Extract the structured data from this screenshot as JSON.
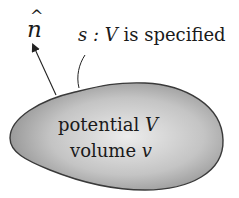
{
  "figure": {
    "normal_vector": {
      "symbol": "n",
      "accent": "^"
    },
    "surface_label": {
      "prefix": "s : ",
      "var": "V",
      "suffix": " is specified"
    },
    "region": {
      "line1": {
        "text": "potential ",
        "var": "V"
      },
      "line2": {
        "text": "volume ",
        "var": "v"
      }
    },
    "colors": {
      "fill_center": "#ececec",
      "fill_edge": "#8f8f8f",
      "outline": "#3a3a3a",
      "text": "#1a1a1a"
    }
  }
}
